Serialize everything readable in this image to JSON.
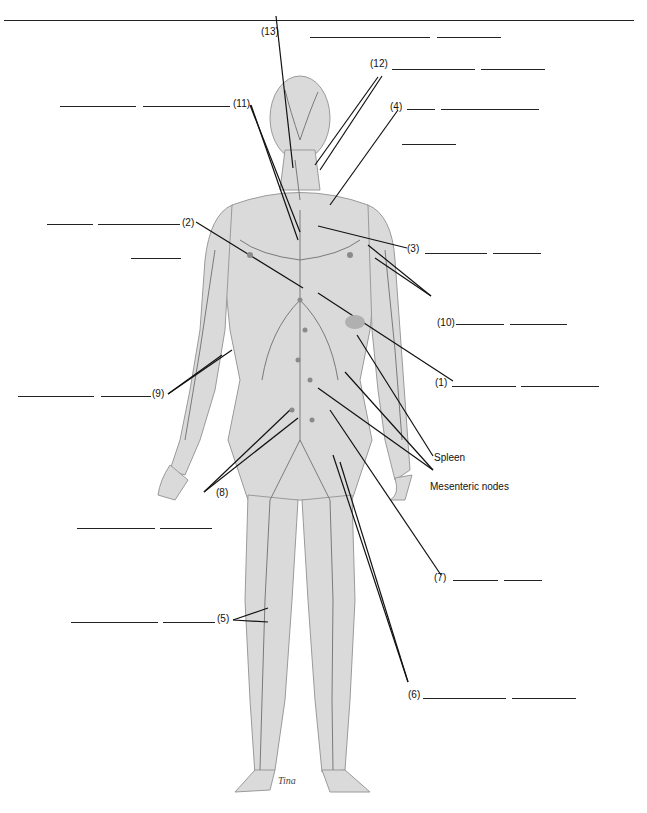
{
  "diagram": {
    "named_labels": [
      {
        "id": "spleen",
        "text": "Spleen"
      },
      {
        "id": "mesenteric",
        "text": "Mesenteric nodes"
      }
    ],
    "numbered_labels": [
      {
        "num": "(1)",
        "blanks": 2
      },
      {
        "num": "(2)",
        "blanks": 3
      },
      {
        "num": "(3)",
        "blanks": 2
      },
      {
        "num": "(4)",
        "blanks": 3
      },
      {
        "num": "(5)",
        "blanks": 2
      },
      {
        "num": "(6)",
        "blanks": 2
      },
      {
        "num": "(7)",
        "blanks": 2
      },
      {
        "num": "(8)",
        "blanks": 2
      },
      {
        "num": "(9)",
        "blanks": 2
      },
      {
        "num": "(10)",
        "blanks": 2
      },
      {
        "num": "(11)",
        "blanks": 2
      },
      {
        "num": "(12)",
        "blanks": 2
      },
      {
        "num": "(13)",
        "blanks": 2
      }
    ],
    "artist_signature": "Tina",
    "colors": {
      "line": "#111111",
      "body_fill": "#d9d9d9",
      "vessel": "#7a7a7a"
    }
  },
  "labels": {
    "n1": "(1)",
    "n2": "(2)",
    "n3": "(3)",
    "n4": "(4)",
    "n5": "(5)",
    "n6": "(6)",
    "n7": "(7)",
    "n8": "(8)",
    "n9": "(9)",
    "n10": "(10)",
    "n11": "(11)",
    "n12": "(12)",
    "n13": "(13)",
    "spleen": "Spleen",
    "mesenteric": "Mesenteric nodes"
  }
}
